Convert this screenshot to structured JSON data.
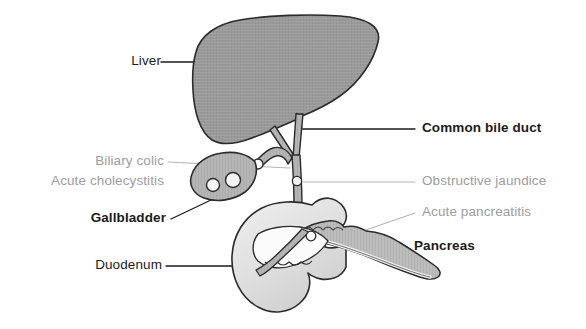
{
  "diagram": {
    "type": "anatomical-illustration",
    "background_color": "#ffffff",
    "colors": {
      "liver_fill": "#9a9a9a",
      "gallbladder_fill": "#b5b5b5",
      "duct_fill": "#a8a8a8",
      "duodenum_fill": "#e2e2e2",
      "pancreas_fill": "#b9b9b9",
      "stone_fill": "#ffffff",
      "outline": "#2b2b2b",
      "label_primary": "#1b1b1b",
      "label_secondary": "#9d9d9d",
      "leader_primary": "#1b1b1b",
      "leader_secondary": "#b0b0b0"
    }
  },
  "labels": {
    "liver": {
      "text": "Liver",
      "style": "plain",
      "side": "left",
      "structure": "liver"
    },
    "biliary_colic": {
      "text": "Biliary colic",
      "style": "secondary",
      "side": "left",
      "structure": "cystic-duct"
    },
    "acute_cholecystitis": {
      "text": "Acute cholecystitis",
      "style": "secondary",
      "side": "left",
      "structure": "gallbladder"
    },
    "gallbladder": {
      "text": "Gallbladder",
      "style": "primary",
      "side": "left",
      "structure": "gallbladder"
    },
    "duodenum": {
      "text": "Duodenum",
      "style": "plain",
      "side": "left",
      "structure": "duodenum"
    },
    "common_bile_duct": {
      "text": "Common bile duct",
      "style": "primary",
      "side": "right",
      "structure": "common-bile-duct"
    },
    "obstructive_jaundice": {
      "text": "Obstructive jaundice",
      "style": "secondary",
      "side": "right",
      "structure": "common-bile-duct-stone"
    },
    "acute_pancreatitis": {
      "text": "Acute pancreatitis",
      "style": "secondary",
      "side": "right",
      "structure": "ampulla-stone"
    },
    "pancreas": {
      "text": "Pancreas",
      "style": "primary",
      "side": "right",
      "structure": "pancreas"
    }
  },
  "structures": [
    {
      "name": "liver",
      "label": "Liver"
    },
    {
      "name": "gallbladder",
      "label": "Gallbladder"
    },
    {
      "name": "cystic-duct",
      "label": "Cystic duct"
    },
    {
      "name": "common-bile-duct",
      "label": "Common bile duct"
    },
    {
      "name": "duodenum",
      "label": "Duodenum"
    },
    {
      "name": "pancreas",
      "label": "Pancreas"
    },
    {
      "name": "pancreatic-duct",
      "label": "Pancreatic duct"
    }
  ],
  "gallstones": [
    {
      "location": "gallbladder",
      "count": 2
    },
    {
      "location": "cystic-duct-neck",
      "count": 1
    },
    {
      "location": "common-bile-duct",
      "count": 1
    },
    {
      "location": "ampulla-of-vater",
      "count": 1
    }
  ]
}
